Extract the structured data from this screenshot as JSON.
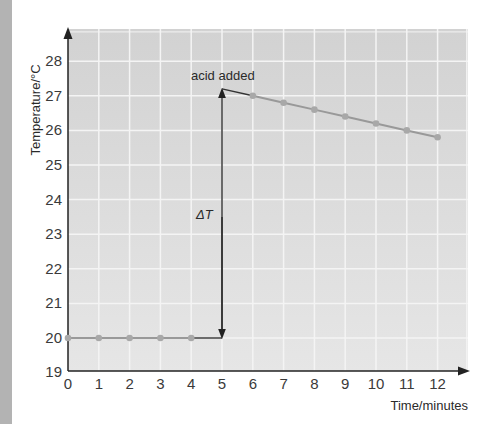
{
  "chart_data": {
    "type": "line",
    "title": "",
    "xlabel": "Time/minutes",
    "ylabel": "Temperature/°C",
    "xlim": [
      0,
      12.7
    ],
    "ylim": [
      19,
      28.9
    ],
    "x_ticks": [
      0,
      1,
      2,
      3,
      4,
      5,
      6,
      7,
      8,
      9,
      10,
      11,
      12
    ],
    "y_ticks": [
      19,
      20,
      21,
      22,
      23,
      24,
      25,
      26,
      27,
      28
    ],
    "grid": true,
    "series": [
      {
        "name": "before acid",
        "x": [
          0,
          1,
          2,
          3,
          4
        ],
        "y": [
          20,
          20,
          20,
          20,
          20
        ]
      },
      {
        "name": "after acid",
        "x": [
          6,
          7,
          8,
          9,
          10,
          11,
          12
        ],
        "y": [
          27.0,
          26.8,
          26.6,
          26.4,
          26.2,
          26.0,
          25.8
        ]
      }
    ],
    "extrapolation": [
      {
        "x": [
          4,
          5
        ],
        "y": [
          20,
          20
        ]
      },
      {
        "x": [
          5,
          6
        ],
        "y": [
          27.2,
          27.0
        ]
      }
    ],
    "annotations": [
      {
        "text": "acid added",
        "x": 5,
        "y": 27.2
      },
      {
        "text": "ΔT",
        "x": 5,
        "y": 23.5,
        "note": "double arrow from 20 to 27.2 at x=5"
      }
    ],
    "colors": {
      "plot_bg": "#dcdcdc",
      "grid": "#f4f4f4",
      "data": "#999999",
      "axis": "#222222"
    }
  }
}
